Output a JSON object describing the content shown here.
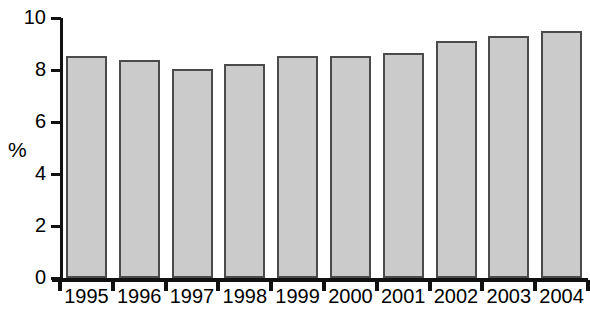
{
  "chart_data": {
    "type": "bar",
    "title": "",
    "subtitle": "",
    "xlabel": "",
    "ylabel": "%",
    "categories": [
      "1995",
      "1996",
      "1997",
      "1998",
      "1999",
      "2000",
      "2001",
      "2002",
      "2003",
      "2004"
    ],
    "values": [
      8.55,
      8.4,
      8.05,
      8.25,
      8.55,
      8.55,
      8.65,
      9.1,
      9.3,
      9.5
    ],
    "series": [
      {
        "name": "",
        "values": [
          8.55,
          8.4,
          8.05,
          8.25,
          8.55,
          8.55,
          8.65,
          9.1,
          9.3,
          9.5
        ]
      }
    ],
    "ylim": [
      0,
      10
    ],
    "yticks": [
      0,
      2,
      4,
      6,
      8,
      10
    ],
    "ytick_labels": [
      "0",
      "2",
      "4",
      "6",
      "8",
      "10"
    ],
    "xtick_labels": [
      "1995",
      "1996",
      "1997",
      "1998",
      "1999",
      "2000",
      "2001",
      "2002",
      "2003",
      "2004"
    ],
    "grid": false,
    "legend": null,
    "legend_position": "none",
    "bar_fill_color": "#cbcbcb",
    "bar_border_color": "#4b4b4b",
    "axis_color": "#111111",
    "background_color": "#ffffff",
    "annotations": []
  },
  "axis": {
    "y_title": "%",
    "y_labels": [
      "10",
      "8",
      "6",
      "4",
      "2",
      "0"
    ],
    "x_labels": [
      "1995",
      "1996",
      "1997",
      "1998",
      "1999",
      "2000",
      "2001",
      "2002",
      "2003",
      "2004"
    ]
  }
}
